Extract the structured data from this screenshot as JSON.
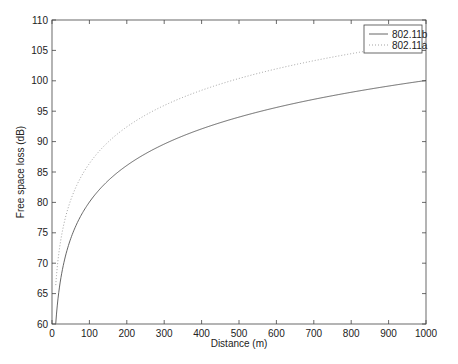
{
  "chart_data": {
    "type": "line",
    "title": "",
    "xlabel": "Distance (m)",
    "ylabel": "Free space loss (dB)",
    "xlim": [
      0,
      1000
    ],
    "ylim": [
      60,
      110
    ],
    "xticks": [
      0,
      100,
      200,
      300,
      400,
      500,
      600,
      700,
      800,
      900,
      1000
    ],
    "yticks": [
      60,
      65,
      70,
      75,
      80,
      85,
      90,
      95,
      100,
      105,
      110
    ],
    "grid": false,
    "legend_position": "upper right",
    "x": [
      10,
      25,
      50,
      100,
      150,
      200,
      300,
      400,
      500,
      600,
      700,
      800,
      900,
      1000
    ],
    "series": [
      {
        "name": "802.11b",
        "style": "solid",
        "color": "#555555",
        "values": [
          60.05,
          68.0,
          74.0,
          80.05,
          83.6,
          86.1,
          89.6,
          92.1,
          94.0,
          95.6,
          96.95,
          98.1,
          99.1,
          100.05
        ]
      },
      {
        "name": "802.11a",
        "style": "dotted",
        "color": "#999999",
        "values": [
          66.4,
          74.4,
          80.4,
          86.4,
          90.0,
          92.5,
          96.0,
          98.5,
          100.4,
          102.0,
          103.3,
          104.5,
          105.5,
          106.4
        ]
      }
    ]
  }
}
